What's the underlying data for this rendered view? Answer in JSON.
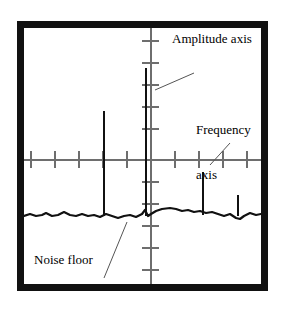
{
  "figure": {
    "kind": "spectrum-analyzer-display",
    "background_color": "#ffffff",
    "frame_color": "#111111",
    "axis_color": "#6e6e6e",
    "trace_color": "#111111"
  },
  "annotations": {
    "amplitude": {
      "text": "Amplitude axis",
      "lines": [
        "Amplitude axis"
      ]
    },
    "frequency": {
      "text": "Frequency axis",
      "lines": [
        "Frequency",
        "axis"
      ],
      "line1": "Frequency",
      "line2": "axis"
    },
    "noise": {
      "text": "Noise floor",
      "lines": [
        "Noise floor"
      ]
    }
  },
  "chart_data": {
    "type": "line",
    "title": "",
    "xlabel": "Frequency axis",
    "ylabel": "Amplitude axis",
    "grid": false,
    "legend": "none",
    "axes": {
      "vertical_axis_x_px": 126,
      "horizontal_axis_y_px": 131,
      "vertical_tick_count": 11,
      "vertical_tick_spacing_px": 22,
      "vertical_tick_length_px": 17,
      "horizontal_tick_count": 10,
      "horizontal_tick_spacing_px": 24,
      "horizontal_tick_length_px": 17,
      "vertical_ticks_y_px": [
        12,
        34,
        56,
        78,
        100,
        153,
        175,
        197,
        219,
        241
      ],
      "horizontal_ticks_x_px": [
        6,
        30,
        54,
        78,
        102,
        150,
        174,
        198,
        222,
        246
      ]
    },
    "noise_floor": {
      "label": "Noise floor",
      "baseline_y_px": 187,
      "points": [
        [
          0,
          188
        ],
        [
          6,
          186
        ],
        [
          12,
          188
        ],
        [
          18,
          187
        ],
        [
          22,
          185
        ],
        [
          28,
          188
        ],
        [
          34,
          187
        ],
        [
          40,
          184
        ],
        [
          46,
          187
        ],
        [
          52,
          188
        ],
        [
          58,
          186
        ],
        [
          64,
          188
        ],
        [
          70,
          187
        ],
        [
          76,
          189
        ],
        [
          82,
          186
        ],
        [
          88,
          188
        ],
        [
          94,
          190
        ],
        [
          100,
          188
        ],
        [
          106,
          187
        ],
        [
          112,
          189
        ],
        [
          118,
          186
        ],
        [
          121,
          182
        ],
        [
          124,
          188
        ],
        [
          127,
          186
        ],
        [
          132,
          183
        ],
        [
          138,
          181
        ],
        [
          146,
          180
        ],
        [
          152,
          181
        ],
        [
          158,
          183
        ],
        [
          164,
          182
        ],
        [
          170,
          184
        ],
        [
          176,
          183
        ],
        [
          182,
          185
        ],
        [
          188,
          184
        ],
        [
          194,
          186
        ],
        [
          200,
          188
        ],
        [
          206,
          186
        ],
        [
          212,
          190
        ],
        [
          216,
          191
        ],
        [
          220,
          188
        ],
        [
          226,
          185
        ],
        [
          232,
          187
        ],
        [
          237,
          186
        ]
      ]
    },
    "peaks": [
      {
        "name": "peak-1",
        "x_px": 79,
        "top_y_px": 83,
        "bottom_y_px": 188,
        "height_px": 105,
        "relative_amplitude": 1.0
      },
      {
        "name": "peak-2",
        "x_px": 121,
        "top_y_px": 40,
        "bottom_y_px": 188,
        "height_px": 148,
        "relative_amplitude": 1.41
      },
      {
        "name": "peak-3",
        "x_px": 178,
        "top_y_px": 144,
        "bottom_y_px": 187,
        "height_px": 43,
        "relative_amplitude": 0.41
      },
      {
        "name": "peak-4",
        "x_px": 213,
        "top_y_px": 167,
        "bottom_y_px": 188,
        "height_px": 21,
        "relative_amplitude": 0.2
      }
    ],
    "leaders": [
      {
        "name": "amplitude-leader",
        "from": [
          170,
          45
        ],
        "to": [
          131,
          62
        ]
      },
      {
        "name": "frequency-leader",
        "from": [
          206,
          115
        ],
        "to": [
          186,
          137
        ]
      },
      {
        "name": "noise-leader",
        "from": [
          80,
          250
        ],
        "to": [
          103,
          194
        ]
      }
    ]
  }
}
